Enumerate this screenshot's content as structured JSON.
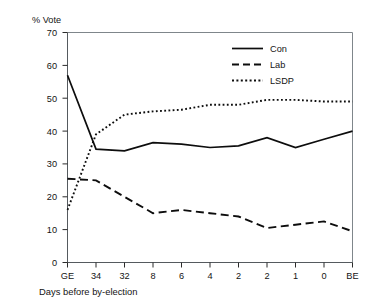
{
  "chart_data": {
    "type": "line",
    "title": "",
    "ylabel": "% Vote",
    "xlabel": "Days before by-election",
    "ylim": [
      0,
      70
    ],
    "yticks": [
      0,
      10,
      20,
      30,
      40,
      50,
      60,
      70
    ],
    "grid": false,
    "legend_position": "top-right",
    "categories": [
      "GE",
      "34",
      "32",
      "8",
      "6",
      "4",
      "2",
      "2",
      "1",
      "0",
      "BE"
    ],
    "series": [
      {
        "name": "Con",
        "style": "solid",
        "values": [
          57,
          34.5,
          34,
          36.5,
          36,
          35,
          35.5,
          38,
          35,
          37.5,
          40
        ]
      },
      {
        "name": "Lab",
        "style": "dashed",
        "values": [
          25.5,
          25,
          20,
          15,
          16,
          15,
          14,
          10.5,
          11.5,
          12.5,
          9.5
        ]
      },
      {
        "name": "LSDP",
        "style": "dotted",
        "values": [
          16,
          39,
          45,
          46,
          46.5,
          48,
          48,
          49.5,
          49.5,
          49,
          49
        ]
      }
    ]
  },
  "axes": {
    "y_label": "% Vote",
    "x_label": "Days before by-election",
    "y_tick_labels": [
      "70",
      "60",
      "50",
      "40",
      "30",
      "20",
      "10",
      "0"
    ],
    "x_tick_labels": [
      "GE",
      "34",
      "32",
      "8",
      "6",
      "4",
      "2",
      "2",
      "1",
      "0",
      "BE"
    ]
  },
  "legend": {
    "items": [
      {
        "label": "Con"
      },
      {
        "label": "Lab"
      },
      {
        "label": "LSDP"
      }
    ]
  }
}
